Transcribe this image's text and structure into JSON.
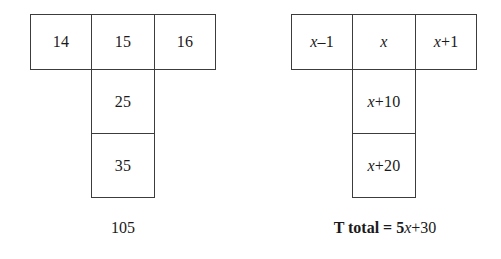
{
  "page": {
    "background_color": "#ffffff",
    "line_color": "#3c3c3c",
    "text_color": "#1a1a1a"
  },
  "figures": [
    {
      "id": "numbers",
      "name": "numeric-t-shape",
      "cells": {
        "top_left": "14",
        "top_middle": "15",
        "top_right": "16",
        "stem_upper": "25",
        "stem_lower": "35"
      },
      "caption": {
        "lead": "",
        "tail": "105",
        "full": "105"
      }
    },
    {
      "id": "algebra",
      "name": "algebraic-t-shape",
      "cells": {
        "top_left_prefix": "x",
        "top_left_suffix": "–1",
        "top_middle": "x",
        "top_right_prefix": "x",
        "top_right_suffix": "+1",
        "stem_upper_prefix": "x",
        "stem_upper_suffix": "+10",
        "stem_lower_prefix": "x",
        "stem_lower_suffix": "+20"
      },
      "caption": {
        "lead": "T total = 5",
        "var": "x",
        "tail": "+30",
        "full": "T total = 5x+30"
      }
    }
  ]
}
